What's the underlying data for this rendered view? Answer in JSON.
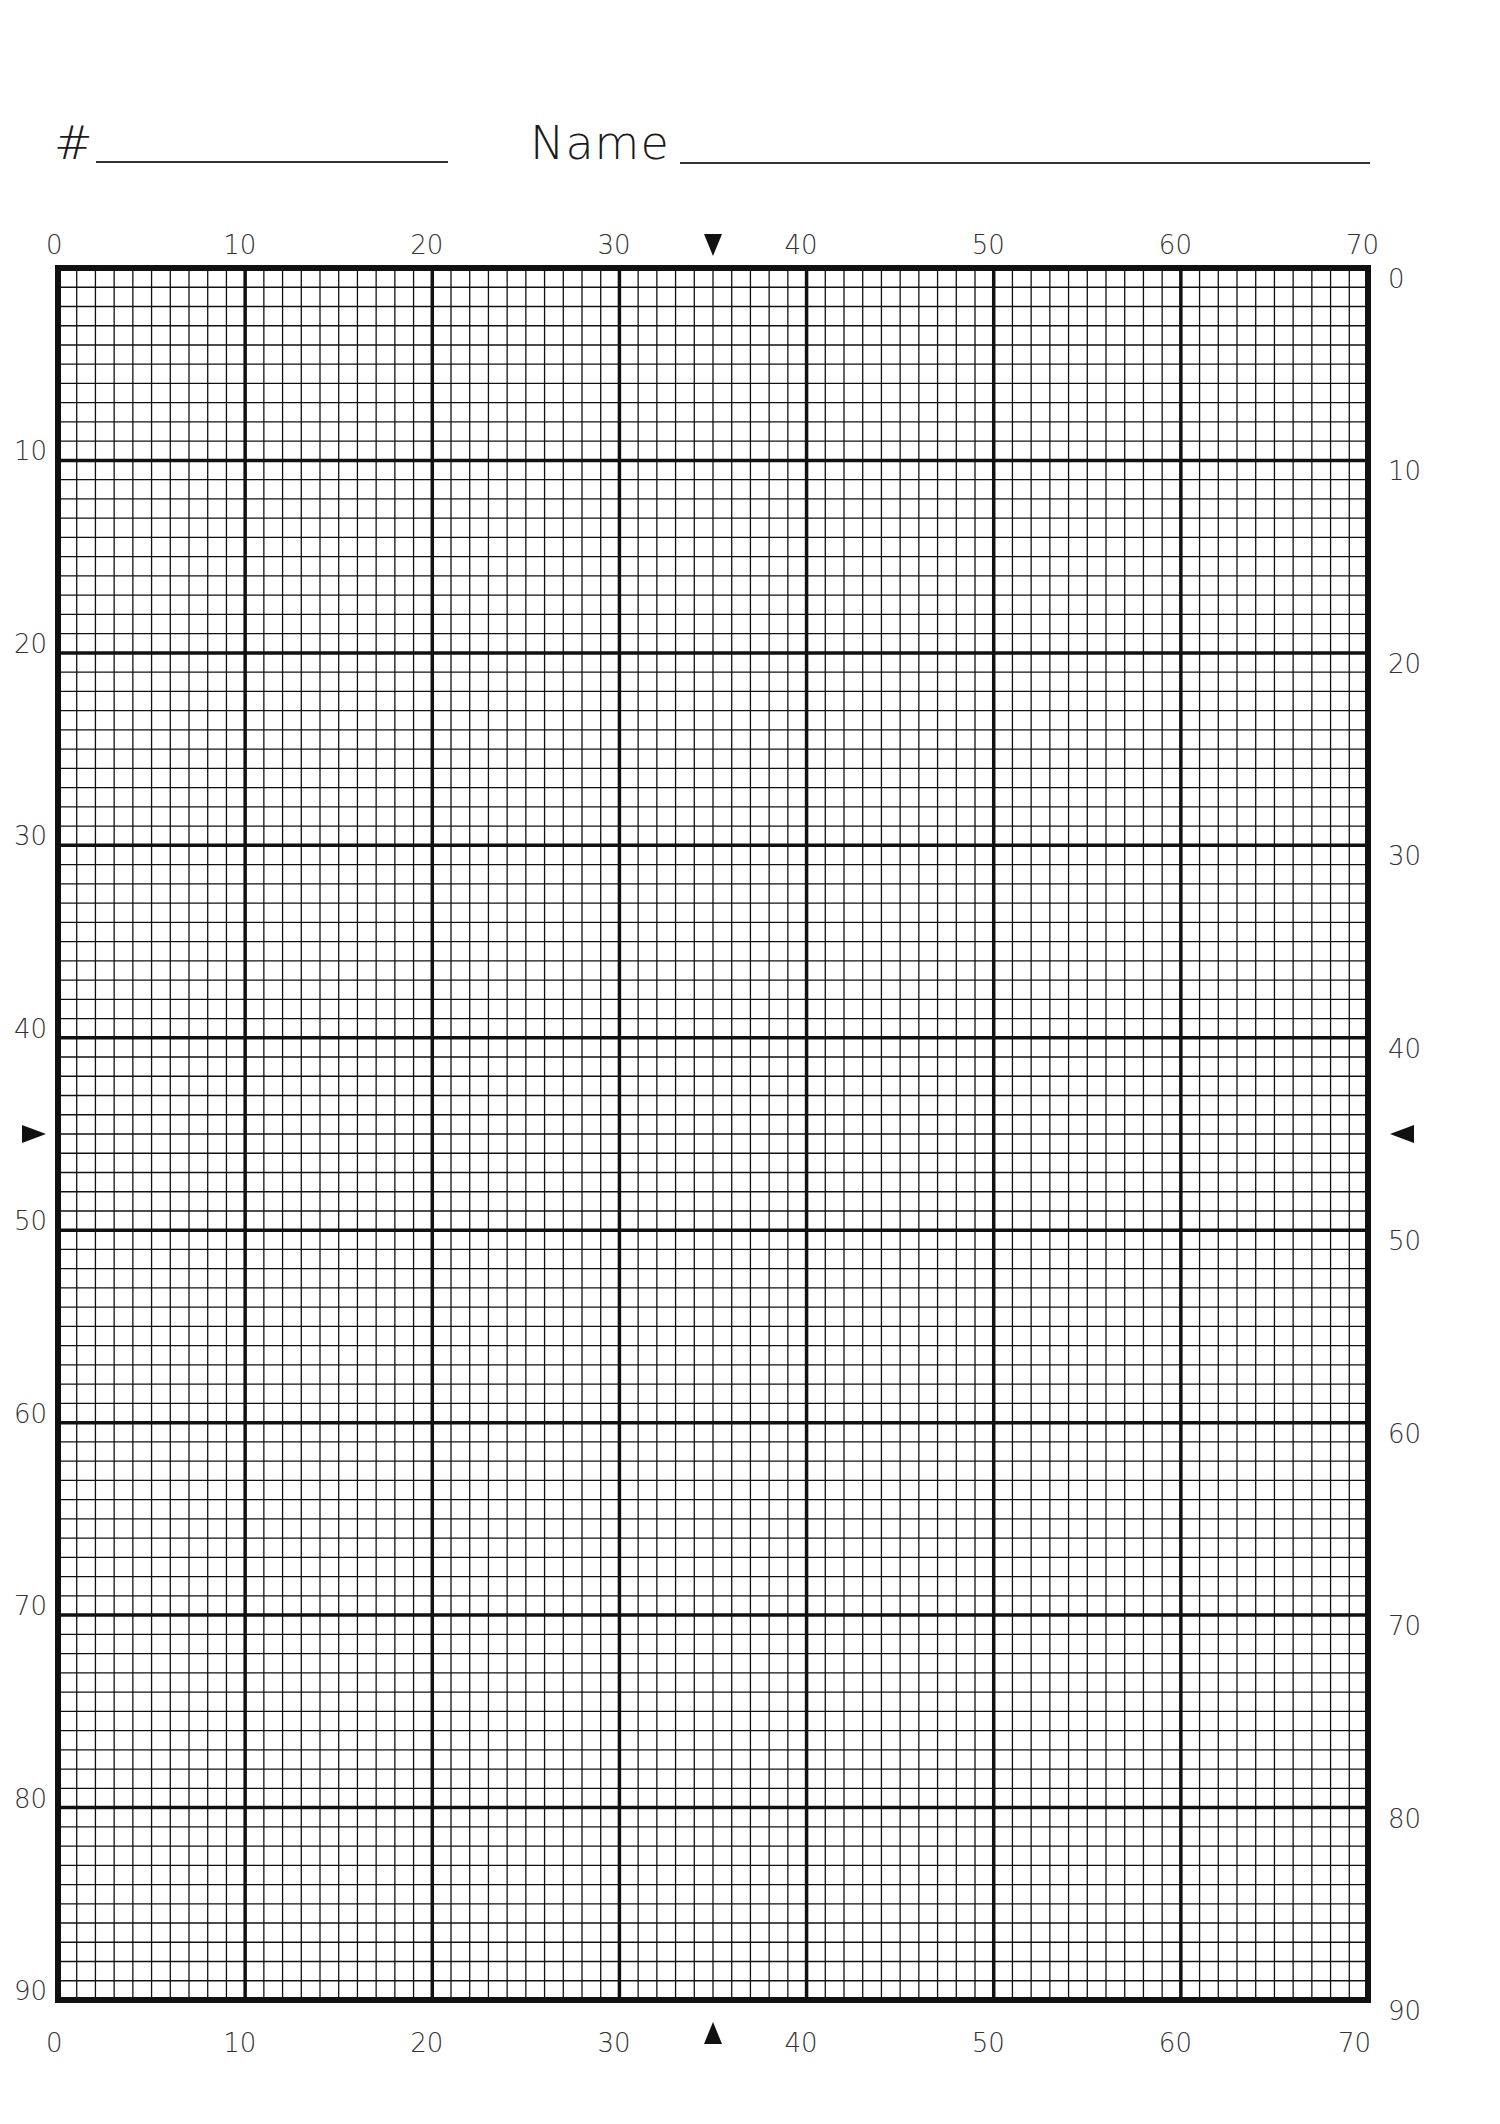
{
  "header": {
    "number_label": "#",
    "name_label": "Name"
  },
  "grid": {
    "columns": 70,
    "rows": 90,
    "major_every": 10,
    "line_color": "#111111",
    "top_labels": [
      "0",
      "10",
      "20",
      "30",
      "40",
      "50",
      "60",
      "70"
    ],
    "bottom_labels": [
      "0",
      "10",
      "20",
      "30",
      "40",
      "50",
      "60",
      "70"
    ],
    "left_labels": [
      "10",
      "20",
      "30",
      "40",
      "50",
      "60",
      "70",
      "80",
      "90"
    ],
    "right_labels": [
      "0",
      "10",
      "20",
      "30",
      "40",
      "50",
      "60",
      "70",
      "80",
      "90"
    ],
    "center_markers": {
      "column": 35,
      "row": 45,
      "top": "down-triangle",
      "bottom": "up-triangle",
      "left": "right-triangle",
      "right": "left-triangle"
    }
  }
}
